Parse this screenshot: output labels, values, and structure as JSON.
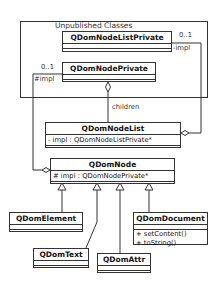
{
  "package": {
    "label": "Unpublished Classes"
  },
  "classes": {
    "node_list_private": {
      "name": "QDomNodeListPrivate"
    },
    "node_private": {
      "name": "QDomNodePrivate"
    },
    "node_list": {
      "name": "QDomNodeList",
      "attributes": [
        "- impl : QDomNodeListPrivate*"
      ]
    },
    "node": {
      "name": "QDomNode",
      "attributes": [
        "# impl : QDomNodePrivate*"
      ]
    },
    "element": {
      "name": "QDomElement"
    },
    "text": {
      "name": "QDomText"
    },
    "attr": {
      "name": "QDomAttr"
    },
    "document": {
      "name": "QDomDocument",
      "operations": [
        "+ setContent()",
        "+ toString()"
      ]
    }
  },
  "associations": {
    "list_impl": {
      "multiplicity": "0..1",
      "role": "-impl"
    },
    "node_impl": {
      "multiplicity": "0..1",
      "role": "#impl"
    },
    "children": {
      "label": "children"
    }
  }
}
